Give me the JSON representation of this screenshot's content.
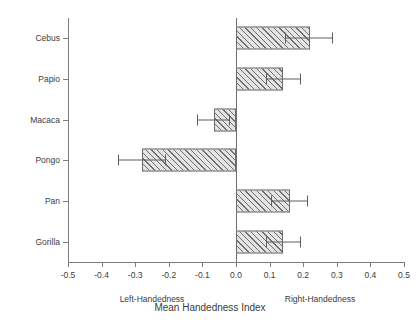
{
  "chart_data": {
    "type": "bar",
    "orientation": "horizontal",
    "title": "",
    "xlabel": "Mean Handedness Index",
    "ylabel": "",
    "xlim": [
      -0.5,
      0.5
    ],
    "grid": false,
    "legend": null,
    "xticks": [
      "-0.5",
      "-0.4",
      "-0.3",
      "-0.2",
      "-0.1",
      "0.0",
      "0.1",
      "0.2",
      "0.3",
      "0.4",
      "0.5"
    ],
    "xtick_values": [
      -0.5,
      -0.4,
      -0.3,
      -0.2,
      -0.1,
      0.0,
      0.1,
      0.2,
      0.3,
      0.4,
      0.5
    ],
    "categories": [
      "Cebus",
      "Papio",
      "Macaca",
      "Pongo",
      "Pan",
      "Gorilla"
    ],
    "values": [
      0.22,
      0.14,
      -0.065,
      -0.28,
      0.16,
      0.14
    ],
    "error_low": [
      0.145,
      0.09,
      -0.115,
      -0.35,
      0.105,
      0.09
    ],
    "error_high": [
      0.285,
      0.19,
      -0.02,
      -0.21,
      0.21,
      0.19
    ],
    "annotations": [
      {
        "text": "Left-Handedness",
        "x": -0.25
      },
      {
        "text": "Right-Handedness",
        "x": 0.25
      }
    ],
    "bars": [
      {
        "label": "Cebus",
        "value": 0.22,
        "err_low": 0.145,
        "err_high": 0.285
      },
      {
        "label": "Papio",
        "value": 0.14,
        "err_low": 0.09,
        "err_high": 0.19
      },
      {
        "label": "Macaca",
        "value": -0.065,
        "err_low": -0.115,
        "err_high": -0.02
      },
      {
        "label": "Pongo",
        "value": -0.28,
        "err_low": -0.35,
        "err_high": -0.21
      },
      {
        "label": "Pan",
        "value": 0.16,
        "err_low": 0.105,
        "err_high": 0.21
      },
      {
        "label": "Gorilla",
        "value": 0.14,
        "err_low": 0.09,
        "err_high": 0.19
      }
    ],
    "colors": {
      "bar_fill": "#e4e4e4",
      "bar_edge": "#6b6b6b",
      "hatch": "#5a5a5a",
      "axis": "#7d7d7d",
      "text": "#3d3d3d",
      "background": "#ffffff"
    }
  }
}
